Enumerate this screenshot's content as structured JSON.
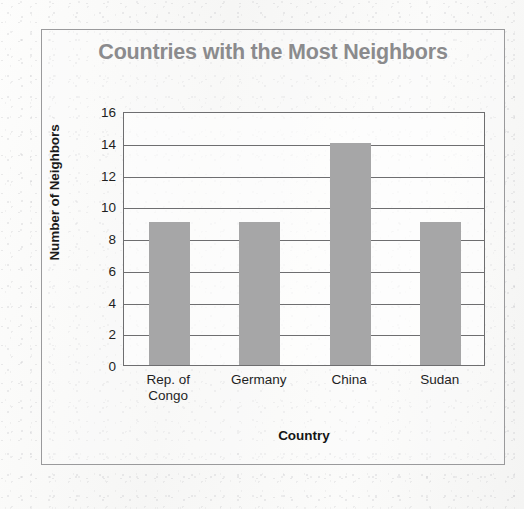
{
  "chart_data": {
    "type": "bar",
    "title": "Countries with the Most Neighbors",
    "xlabel": "Country",
    "ylabel": "Number of Neighbors",
    "categories": [
      "Rep. of Congo",
      "Germany",
      "China",
      "Sudan"
    ],
    "category_lines": [
      [
        "Rep. of",
        "Congo"
      ],
      [
        "Germany"
      ],
      [
        "China"
      ],
      [
        "Sudan"
      ]
    ],
    "values": [
      9,
      9,
      14,
      9
    ],
    "ylim": [
      0,
      16
    ],
    "yticks": [
      0,
      2,
      4,
      6,
      8,
      10,
      12,
      14,
      16
    ],
    "ytick_labels": [
      "0",
      "2",
      "4",
      "6",
      "8",
      "10",
      "12",
      "14",
      "16"
    ],
    "grid": true,
    "grid_axis": "y",
    "legend": false,
    "bar_color": "#a6a6a7",
    "title_color": "#8b8b8d",
    "axis_color": "#6e6e70",
    "text_color": "#1f1f1f"
  }
}
